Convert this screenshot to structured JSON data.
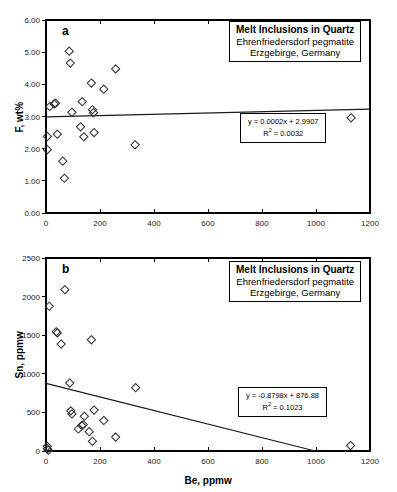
{
  "figure": {
    "background": "#ffffff",
    "marker_color": "#333333",
    "line_color": "#1a1a1a",
    "axis_color": "#000000"
  },
  "panels": [
    {
      "letter": "a",
      "title_box": {
        "line1": "Melt Inclusions in Quartz",
        "line2": "Ehrenfriedersdorf pegmatite",
        "line3": "Erzgebirge, Germany"
      },
      "equation": {
        "fit": "y = 0.0002x + 2.9907",
        "r_squared_prefix": "R",
        "r_squared_sup": "2",
        "r_squared_value": " = 0.0032"
      }
    },
    {
      "letter": "b",
      "title_box": {
        "line1": "Melt Inclusions in Quartz",
        "line2": "Ehrenfriedersdorf pegmatite",
        "line3": "Erzgebirge, Germany"
      },
      "equation": {
        "fit": "y = -0.8798x + 876.88",
        "r_squared_prefix": "R",
        "r_squared_sup": "2",
        "r_squared_value": " = 0.1023"
      }
    }
  ],
  "chart_data": [
    {
      "type": "scatter",
      "panel": "a",
      "title": "Melt Inclusions in Quartz — Ehrenfriedersdorf pegmatite, Erzgebirge, Germany",
      "xlabel": "",
      "ylabel": "F, wt%",
      "xlim": [
        0,
        1200
      ],
      "ylim": [
        0,
        6
      ],
      "xticks": [
        0,
        200,
        400,
        600,
        800,
        1000,
        1200
      ],
      "yticks": [
        0.0,
        1.0,
        2.0,
        3.0,
        4.0,
        5.0,
        6.0
      ],
      "ytick_labels": [
        "0.00",
        "1.00",
        "2.00",
        "3.00",
        "4.00",
        "5.00",
        "6.00"
      ],
      "xtick_labels": [
        "0",
        "200",
        "400",
        "600",
        "800",
        "1000",
        "1200"
      ],
      "grid": false,
      "legend": false,
      "marker": "open-diamond",
      "points": [
        {
          "x": 5,
          "y": 1.97
        },
        {
          "x": 5,
          "y": 2.38
        },
        {
          "x": 14,
          "y": 3.31
        },
        {
          "x": 30,
          "y": 3.39
        },
        {
          "x": 35,
          "y": 3.41
        },
        {
          "x": 42,
          "y": 2.45
        },
        {
          "x": 62,
          "y": 1.61
        },
        {
          "x": 68,
          "y": 1.08
        },
        {
          "x": 86,
          "y": 5.03
        },
        {
          "x": 90,
          "y": 4.66
        },
        {
          "x": 96,
          "y": 3.13
        },
        {
          "x": 128,
          "y": 2.68
        },
        {
          "x": 134,
          "y": 3.46
        },
        {
          "x": 140,
          "y": 2.37
        },
        {
          "x": 168,
          "y": 4.04
        },
        {
          "x": 172,
          "y": 3.21
        },
        {
          "x": 176,
          "y": 3.12
        },
        {
          "x": 178,
          "y": 2.5
        },
        {
          "x": 214,
          "y": 3.85
        },
        {
          "x": 258,
          "y": 4.48
        },
        {
          "x": 330,
          "y": 2.12
        },
        {
          "x": 1130,
          "y": 2.96
        }
      ],
      "trendline": {
        "equation": "y = 0.0002x + 2.9907",
        "slope": 0.0002,
        "intercept": 2.9907,
        "r_squared": 0.0032,
        "x_start": 0,
        "x_end": 1200
      }
    },
    {
      "type": "scatter",
      "panel": "b",
      "title": "Melt Inclusions in Quartz — Ehrenfriedersdorf pegmatite, Erzgebirge, Germany",
      "xlabel": "Be, ppmw",
      "ylabel": "Sn, ppmw",
      "xlim": [
        0,
        1200
      ],
      "ylim": [
        0,
        2500
      ],
      "xticks": [
        0,
        200,
        400,
        600,
        800,
        1000,
        1200
      ],
      "yticks": [
        0,
        500,
        1000,
        1500,
        2000,
        2500
      ],
      "ytick_labels": [
        "0",
        "500",
        "1000",
        "1500",
        "2000",
        "2500"
      ],
      "xtick_labels": [
        "0",
        "200",
        "400",
        "600",
        "800",
        "1000",
        "1200"
      ],
      "grid": false,
      "legend": false,
      "marker": "open-diamond",
      "points": [
        {
          "x": 5,
          "y": 30
        },
        {
          "x": 5,
          "y": 60
        },
        {
          "x": 8,
          "y": 10
        },
        {
          "x": 12,
          "y": 1875
        },
        {
          "x": 38,
          "y": 1545
        },
        {
          "x": 42,
          "y": 1530
        },
        {
          "x": 56,
          "y": 1385
        },
        {
          "x": 70,
          "y": 2090
        },
        {
          "x": 88,
          "y": 880
        },
        {
          "x": 92,
          "y": 520
        },
        {
          "x": 96,
          "y": 480
        },
        {
          "x": 120,
          "y": 285
        },
        {
          "x": 132,
          "y": 330
        },
        {
          "x": 138,
          "y": 340
        },
        {
          "x": 142,
          "y": 450
        },
        {
          "x": 160,
          "y": 250
        },
        {
          "x": 168,
          "y": 1440
        },
        {
          "x": 172,
          "y": 125
        },
        {
          "x": 178,
          "y": 530
        },
        {
          "x": 214,
          "y": 395
        },
        {
          "x": 258,
          "y": 180
        },
        {
          "x": 332,
          "y": 820
        },
        {
          "x": 1128,
          "y": 70
        }
      ],
      "trendline": {
        "equation": "y = -0.8798x + 876.88",
        "slope": -0.8798,
        "intercept": 876.88,
        "r_squared": 0.1023,
        "x_start": 0,
        "x_end": 996.7
      }
    }
  ]
}
